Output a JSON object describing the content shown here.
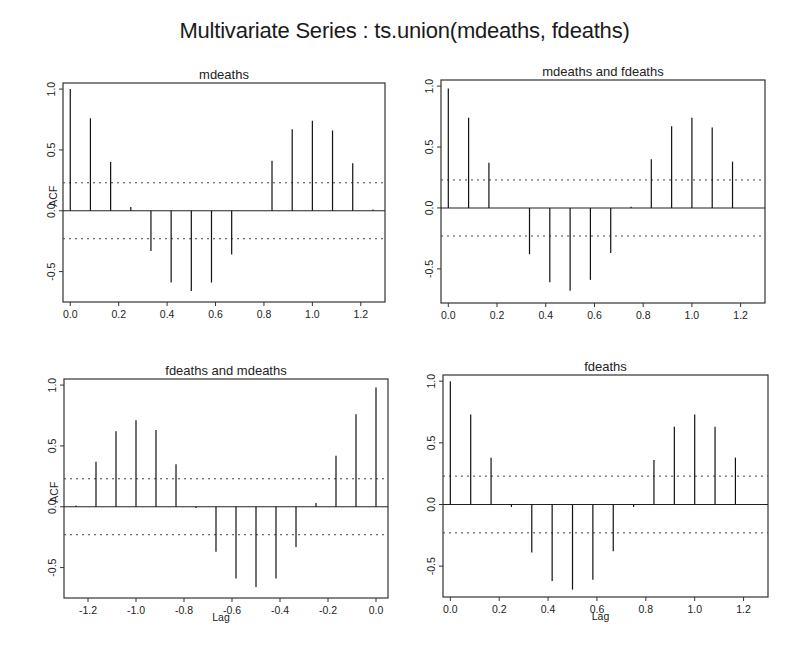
{
  "title": "Multivariate Series : ts.union(mdeaths, fdeaths)",
  "chart_data": [
    {
      "type": "bar",
      "subtype": "acf-lollipop",
      "title": "mdeaths",
      "xlabel": "",
      "ylabel": "ACF",
      "xlim": [
        -0.03,
        1.3
      ],
      "ylim": [
        -0.75,
        1.05
      ],
      "xticks": [
        "0.0",
        "0.2",
        "0.4",
        "0.6",
        "0.8",
        "1.0",
        "1.2"
      ],
      "yticks": [
        "-0.5",
        "0.0",
        "0.5",
        "1.0"
      ],
      "confidence_bounds": [
        0.23,
        -0.23
      ],
      "x": [
        0.0,
        0.0833,
        0.1667,
        0.25,
        0.3333,
        0.4167,
        0.5,
        0.5833,
        0.6667,
        0.75,
        0.8333,
        0.9167,
        1.0,
        1.0833,
        1.1667,
        1.25
      ],
      "values": [
        1.0,
        0.76,
        0.4,
        0.03,
        -0.33,
        -0.59,
        -0.66,
        -0.59,
        -0.36,
        0.0,
        0.41,
        0.67,
        0.74,
        0.66,
        0.39,
        0.01
      ]
    },
    {
      "type": "bar",
      "subtype": "acf-lollipop",
      "title": "mdeaths and fdeaths",
      "xlabel": "",
      "ylabel": "",
      "xlim": [
        -0.03,
        1.3
      ],
      "ylim": [
        -0.78,
        1.05
      ],
      "xticks": [
        "0.0",
        "0.2",
        "0.4",
        "0.6",
        "0.8",
        "1.0",
        "1.2"
      ],
      "yticks": [
        "-0.5",
        "0.0",
        "0.5",
        "1.0"
      ],
      "confidence_bounds": [
        0.23,
        -0.23
      ],
      "x": [
        0.0,
        0.0833,
        0.1667,
        0.25,
        0.3333,
        0.4167,
        0.5,
        0.5833,
        0.6667,
        0.75,
        0.8333,
        0.9167,
        1.0,
        1.0833,
        1.1667,
        1.25
      ],
      "values": [
        0.98,
        0.74,
        0.37,
        0.0,
        -0.38,
        -0.61,
        -0.68,
        -0.59,
        -0.37,
        0.01,
        0.4,
        0.67,
        0.74,
        0.66,
        0.38,
        0.0
      ]
    },
    {
      "type": "bar",
      "subtype": "acf-lollipop",
      "title": "fdeaths and mdeaths",
      "xlabel": "Lag",
      "ylabel": "ACF",
      "xlim": [
        -1.3,
        0.05
      ],
      "ylim": [
        -0.75,
        1.05
      ],
      "xticks": [
        "-1.2",
        "-1.0",
        "-0.8",
        "-0.6",
        "-0.4",
        "-0.2",
        "0.0"
      ],
      "yticks": [
        "-0.5",
        "0.0",
        "0.5",
        "1.0"
      ],
      "confidence_bounds": [
        0.23,
        -0.23
      ],
      "x": [
        -1.25,
        -1.1667,
        -1.0833,
        -1.0,
        -0.9167,
        -0.8333,
        -0.75,
        -0.6667,
        -0.5833,
        -0.5,
        -0.4167,
        -0.3333,
        -0.25,
        -0.1667,
        -0.0833,
        0.0
      ],
      "values": [
        0.01,
        0.37,
        0.62,
        0.71,
        0.63,
        0.35,
        -0.01,
        -0.37,
        -0.59,
        -0.66,
        -0.59,
        -0.33,
        0.03,
        0.42,
        0.76,
        0.98
      ]
    },
    {
      "type": "bar",
      "subtype": "acf-lollipop",
      "title": "fdeaths",
      "xlabel": "Lag",
      "ylabel": "",
      "xlim": [
        -0.03,
        1.3
      ],
      "ylim": [
        -0.75,
        1.05
      ],
      "xticks": [
        "0.0",
        "0.2",
        "0.4",
        "0.6",
        "0.8",
        "1.0",
        "1.2"
      ],
      "yticks": [
        "-0.5",
        "0.0",
        "0.5",
        "1.0"
      ],
      "confidence_bounds": [
        0.23,
        -0.23
      ],
      "x": [
        0.0,
        0.0833,
        0.1667,
        0.25,
        0.3333,
        0.4167,
        0.5,
        0.5833,
        0.6667,
        0.75,
        0.8333,
        0.9167,
        1.0,
        1.0833,
        1.1667,
        1.25
      ],
      "values": [
        1.0,
        0.73,
        0.38,
        -0.02,
        -0.39,
        -0.62,
        -0.69,
        -0.61,
        -0.38,
        -0.02,
        0.36,
        0.63,
        0.73,
        0.63,
        0.38,
        0.0
      ]
    }
  ],
  "panels": [
    {
      "box": [
        63,
        83,
        322,
        219
      ]
    },
    {
      "box": [
        441,
        80,
        324,
        223
      ]
    },
    {
      "box": [
        64,
        379,
        324,
        219
      ]
    },
    {
      "box": [
        443,
        375,
        325,
        222
      ]
    }
  ]
}
